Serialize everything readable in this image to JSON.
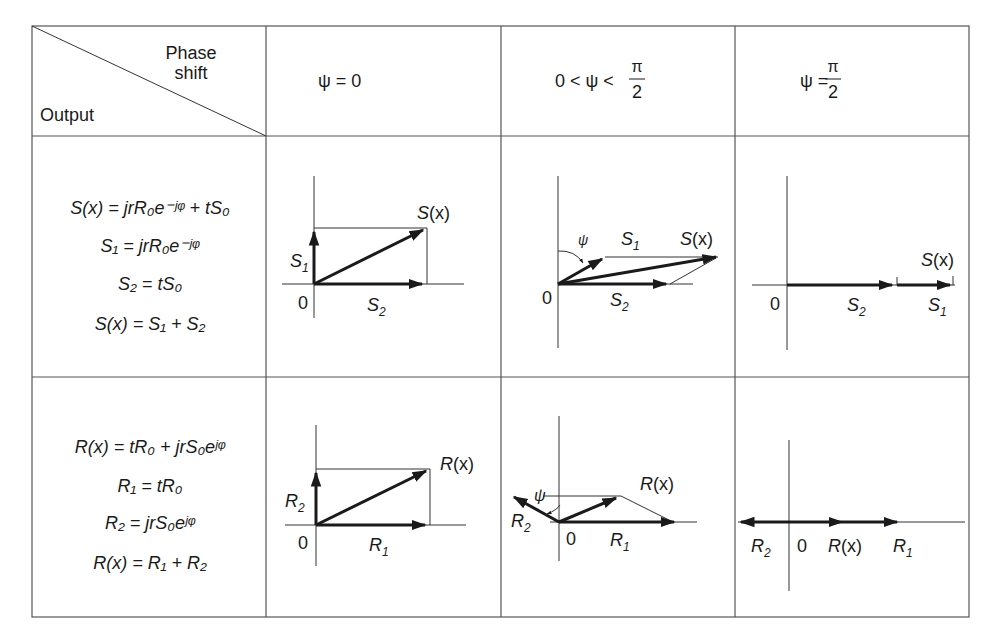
{
  "table": {
    "header": {
      "corner_top": "Phase",
      "corner_top2": "shift",
      "corner_bottom": "Output",
      "col1": "ψ = 0",
      "col2": "0 < ψ <",
      "col3": "ψ =",
      "pi": "π",
      "two": "2"
    },
    "row_s": {
      "eq1": "S(x) = jrR₀e⁻ʲᵠ + tS₀",
      "eq2": "S₁ = jrR₀e⁻ʲᵠ",
      "eq3": "S₂ = tS₀",
      "eq4": "S(x) = S₁ + S₂"
    },
    "row_r": {
      "eq1": "R(x) = tR₀ + jrS₀eʲᵠ",
      "eq2": "R₁ = tR₀",
      "eq3": "R₂ = jrS₀eʲᵠ",
      "eq4": "R(x) = R₁ + R₂"
    },
    "labels": {
      "zero": "0",
      "S": "S",
      "R": "R",
      "x": "(x)",
      "sub1": "1",
      "sub2": "2",
      "psi": "ψ"
    }
  },
  "colors": {
    "ink": "#1a1a1a",
    "grid": "#555555",
    "background": "#ffffff"
  }
}
